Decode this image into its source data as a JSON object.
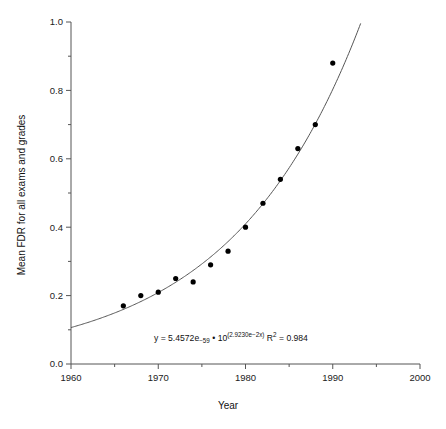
{
  "chart_data": {
    "type": "scatter",
    "title": "",
    "xlabel": "Year",
    "ylabel": "Mean FDR for all exams and grades",
    "xlim": [
      1960,
      2000
    ],
    "ylim": [
      0.0,
      1.0
    ],
    "grid": false,
    "legend": "none",
    "x_ticks": [
      1960,
      1970,
      1980,
      1990,
      2000
    ],
    "x_tick_labels": [
      "1960",
      "1970",
      "1980",
      "1990",
      "2000"
    ],
    "x_minor_ticks": [
      1965,
      1975,
      1985,
      1995
    ],
    "y_ticks": [
      0.0,
      0.2,
      0.4,
      0.6,
      0.8,
      1.0
    ],
    "y_tick_labels": [
      "0.0",
      "0.2",
      "0.4",
      "0.6",
      "0.8",
      "1.0"
    ],
    "y_minor_ticks": [
      0.1,
      0.3,
      0.5,
      0.7,
      0.9
    ],
    "x": [
      1966,
      1968,
      1970,
      1972,
      1974,
      1976,
      1978,
      1980,
      1982,
      1984,
      1986,
      1988,
      1990
    ],
    "values": [
      0.17,
      0.2,
      0.21,
      0.25,
      0.24,
      0.29,
      0.33,
      0.4,
      0.47,
      0.54,
      0.63,
      0.7,
      0.88
    ],
    "series": [
      {
        "name": "Mean FDR",
        "marker": "filled-circle",
        "color": "#000000",
        "points": [
          {
            "x": 1966,
            "y": 0.17
          },
          {
            "x": 1968,
            "y": 0.2
          },
          {
            "x": 1970,
            "y": 0.21
          },
          {
            "x": 1972,
            "y": 0.25
          },
          {
            "x": 1974,
            "y": 0.24
          },
          {
            "x": 1976,
            "y": 0.29
          },
          {
            "x": 1978,
            "y": 0.33
          },
          {
            "x": 1980,
            "y": 0.4
          },
          {
            "x": 1982,
            "y": 0.47
          },
          {
            "x": 1984,
            "y": 0.54
          },
          {
            "x": 1986,
            "y": 0.63
          },
          {
            "x": 1988,
            "y": 0.7
          },
          {
            "x": 1990,
            "y": 0.88
          }
        ]
      }
    ],
    "fit": {
      "type": "exponential",
      "color": "#555555",
      "coefficient": 5.4572e-59,
      "exponent_coefficient": 0.02923,
      "x_start": 1960,
      "x_end": 1993.2,
      "r_squared": 0.984
    },
    "annotations": [
      {
        "name": "regression-equation",
        "x": 1980,
        "y": 0.105,
        "eq_lhs": "y = 5.4572e",
        "eq_lhs_sub": "−59",
        "eq_mid": " • 10",
        "eq_sup": "(2.9230e−2x)",
        "eq_r": " R",
        "eq_r_sup": "2",
        "eq_rval": " = 0.984",
        "full_text": "y = 5.4572e−59 • 10(2.9230e−2x) R2 = 0.984"
      }
    ]
  }
}
